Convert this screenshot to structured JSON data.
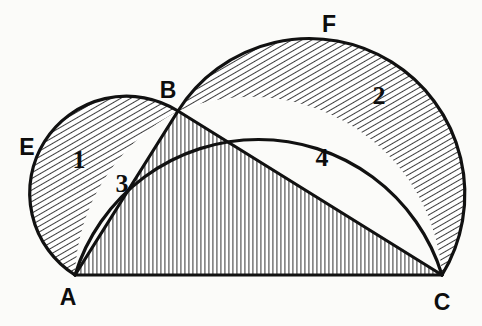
{
  "figure": {
    "kind": "geometry-diagram",
    "background_color": "#fbfbf9",
    "ink_color": "#111111",
    "stroke_width": 3.2
  },
  "points": [
    {
      "id": "A",
      "label": "A",
      "x": 75,
      "y": 275,
      "label_x": 68,
      "label_y": 305
    },
    {
      "id": "B",
      "label": "B",
      "x": 178,
      "y": 111,
      "label_x": 168,
      "label_y": 98
    },
    {
      "id": "C",
      "label": "C",
      "x": 442,
      "y": 275,
      "label_x": 434,
      "label_y": 307
    },
    {
      "id": "E",
      "label": "E",
      "x": 38,
      "y": 195,
      "label_x": 20,
      "label_y": 155
    },
    {
      "id": "F",
      "label": "F",
      "x": 322,
      "y": 38,
      "label_x": 321,
      "label_y": 32
    }
  ],
  "regions": [
    {
      "id": "1",
      "label": "1",
      "label_x": 72,
      "label_y": 168,
      "hatch": "diagonal",
      "name": "lune-on-AB"
    },
    {
      "id": "2",
      "label": "2",
      "label_x": 370,
      "label_y": 104,
      "hatch": "diagonal",
      "name": "lune-on-BC"
    },
    {
      "id": "3",
      "label": "3",
      "label_x": 114,
      "label_y": 190,
      "hatch": "none",
      "name": "segment-AB"
    },
    {
      "id": "4",
      "label": "4",
      "label_x": 314,
      "label_y": 166,
      "hatch": "none",
      "name": "segment-BC"
    }
  ],
  "segments": [
    {
      "id": "AC",
      "name": "base-line-AC",
      "x1": 75,
      "y1": 275,
      "x2": 442,
      "y2": 275
    },
    {
      "id": "AB",
      "name": "chord-AB",
      "x1": 75,
      "y1": 275,
      "x2": 178,
      "y2": 111
    },
    {
      "id": "BC",
      "name": "chord-BC",
      "x1": 178,
      "y1": 111,
      "x2": 442,
      "y2": 275
    }
  ],
  "arcs": [
    {
      "id": "arc-AEB",
      "name": "semicircle-on-AB",
      "cx": 126.5,
      "cy": 193.0,
      "r": 96.8,
      "through": "E"
    },
    {
      "id": "arc-BFC",
      "name": "semicircle-on-BC",
      "cx": 310.0,
      "cy": 193.0,
      "r": 155.4,
      "through": "F"
    },
    {
      "id": "arc-ABC",
      "name": "circumscribed-arc-AC-through-B",
      "cx": 258.5,
      "cy": 340.0,
      "r": 192.0,
      "through": "B"
    }
  ],
  "hatching": {
    "diagonal_color": "#1a1a1a",
    "diagonal_spacing_px": 5,
    "diagonal_angle_deg": 60,
    "vertical_color": "#555555",
    "vertical_spacing_px": 4,
    "triangle_fill_name": "triangle-ABC-vertical-hatch"
  }
}
